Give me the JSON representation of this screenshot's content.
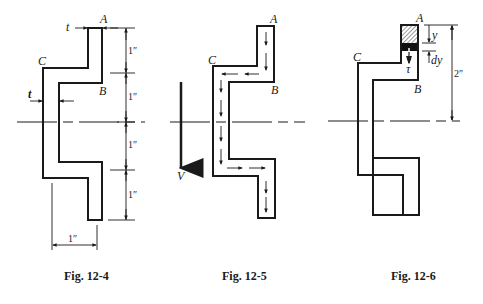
{
  "figures": [
    {
      "id": "fig-12-4",
      "caption": "Fig. 12-4",
      "points": {
        "A": "A",
        "B": "B",
        "C": "C"
      },
      "thickness_label": "t",
      "thickness_label_top": "t",
      "vertical_dims": [
        "1″",
        "1″",
        "1″",
        "1″"
      ],
      "horizontal_dim": "1″"
    },
    {
      "id": "fig-12-5",
      "caption": "Fig. 12-5",
      "points": {
        "A": "A",
        "B": "B",
        "C": "C"
      },
      "force_label": "V"
    },
    {
      "id": "fig-12-6",
      "caption": "Fig. 12-6",
      "points": {
        "A": "A",
        "B": "B",
        "C": "C"
      },
      "y_label": "y",
      "dy_label": "dy",
      "tau_label": "τ",
      "height_dim": "2″"
    }
  ],
  "colors": {
    "ink": "#1a1a1a",
    "background": "#ffffff"
  }
}
